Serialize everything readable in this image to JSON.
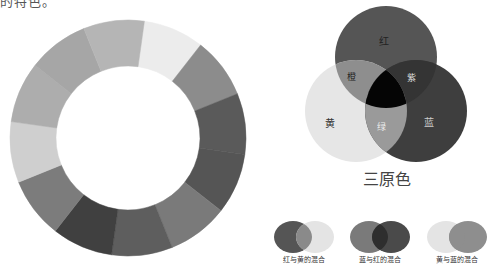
{
  "top_text": "的特色。",
  "color_wheel": {
    "segments": [
      {
        "name": "yellow",
        "shade": "#ececec"
      },
      {
        "name": "yellow-orange",
        "shade": "#8c8c8c"
      },
      {
        "name": "orange",
        "shade": "#5a5a5a"
      },
      {
        "name": "red-orange",
        "shade": "#555555"
      },
      {
        "name": "red",
        "shade": "#7a7a7a"
      },
      {
        "name": "red-violet",
        "shade": "#5e5e5e"
      },
      {
        "name": "violet",
        "shade": "#404040"
      },
      {
        "name": "blue-violet",
        "shade": "#7c7c7c"
      },
      {
        "name": "blue",
        "shade": "#cfcfcf"
      },
      {
        "name": "blue-green",
        "shade": "#adadad"
      },
      {
        "name": "green",
        "shade": "#a6a6a6"
      },
      {
        "name": "yellow-green",
        "shade": "#b5b5b5"
      }
    ]
  },
  "venn": {
    "title": "三原色",
    "circles": {
      "red": {
        "label": "红",
        "shade": "#555555"
      },
      "yellow": {
        "label": "黄",
        "shade": "#e6e6e6"
      },
      "blue": {
        "label": "蓝",
        "shade": "#3e3e3e"
      }
    },
    "overlaps": {
      "orange": {
        "label": "橙",
        "shade": "#8e8e8e"
      },
      "purple": {
        "label": "紫",
        "shade": "#343434"
      },
      "green": {
        "label": "绿",
        "shade": "#9a9a9a"
      },
      "center": {
        "shade": "#050505"
      }
    }
  },
  "mixes": [
    {
      "label": "红与黄的混合",
      "left": "#555555",
      "right": "#e4e4e4",
      "overlap": "#8a8a8a"
    },
    {
      "label": "蓝与红的混合",
      "left": "#7a7a7a",
      "right": "#4a4a4a",
      "overlap": "#2e2e2e"
    },
    {
      "label": "黄与蓝的混合",
      "left": "#e4e4e4",
      "right": "#8e8e8e",
      "overlap": "#8e8e8e"
    }
  ]
}
